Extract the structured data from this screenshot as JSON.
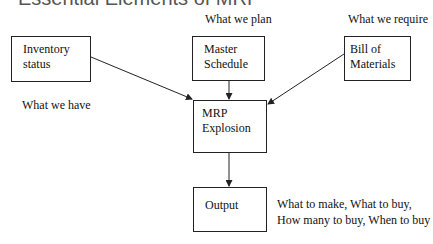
{
  "title": "Essential Elements of MRP",
  "nodes": {
    "inventory": {
      "line1": "Inventory",
      "line2": "status",
      "caption": "What we have"
    },
    "master_schedule": {
      "line1": "Master",
      "line2": "Schedule",
      "caption": "What we plan"
    },
    "bom": {
      "line1": "Bill of",
      "line2": "Materials",
      "caption": "What we require"
    },
    "mrp": {
      "line1": "MRP",
      "line2": "Explosion"
    },
    "output": {
      "line1": "Output",
      "caption1": "What to make, What to buy,",
      "caption2": "How many to buy, When to buy"
    }
  },
  "edges": [
    {
      "from": "inventory",
      "to": "mrp"
    },
    {
      "from": "master_schedule",
      "to": "mrp"
    },
    {
      "from": "bom",
      "to": "mrp"
    },
    {
      "from": "mrp",
      "to": "output"
    }
  ]
}
